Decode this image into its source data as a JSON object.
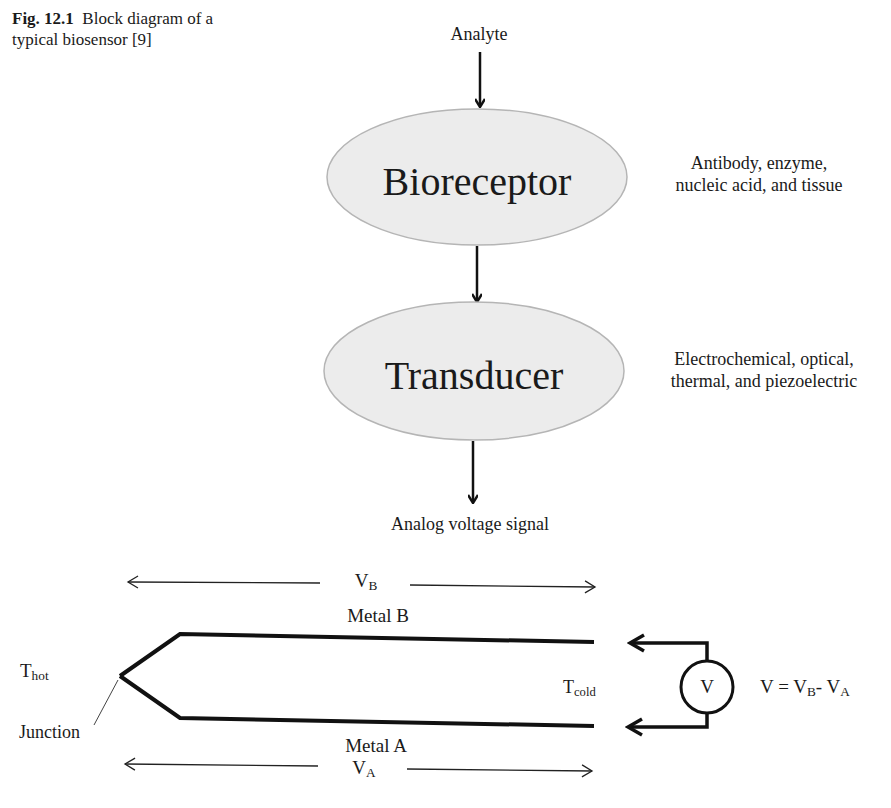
{
  "caption": {
    "figure_number": "Fig. 12.1",
    "text_line1": "Block diagram of a",
    "text_line2": "typical biosensor [9]"
  },
  "block_diagram": {
    "input_label": "Analyte",
    "blocks": [
      {
        "label": "Bioreceptor",
        "note_line1": "Antibody, enzyme,",
        "note_line2": "nucleic acid, and tissue"
      },
      {
        "label": "Transducer",
        "note_line1": "Electrochemical, optical,",
        "note_line2": "thermal, and piezoelectric"
      }
    ],
    "output_label": "Analog voltage signal"
  },
  "thermocouple": {
    "vb_main": "V",
    "vb_sub": "B",
    "va_main": "V",
    "va_sub": "A",
    "metal_b": "Metal B",
    "metal_a": "Metal A",
    "thot_main": "T",
    "thot_sub": "hot",
    "tcold_main": "T",
    "tcold_sub": "cold",
    "junction": "Junction",
    "meter_symbol": "V",
    "equation": {
      "lhs": "V = V",
      "sub1": "B",
      "mid": "- V",
      "sub2": "A"
    }
  },
  "colors": {
    "ellipse_fill": "#ececec",
    "ellipse_stroke": "#b5b5b5",
    "line": "#111111"
  }
}
